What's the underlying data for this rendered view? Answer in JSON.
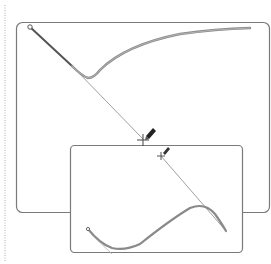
{
  "figure": {
    "colors": {
      "background": "#ffffff",
      "panel_border": "#7a7a7a",
      "curve": "#8a8a8a",
      "curve_dark": "#555555",
      "guide_line": "#a0a0a0",
      "dotted_rule": "#b0b0b0",
      "cursor": "#333333"
    },
    "panels": [
      {
        "name": "panel-1",
        "x": 16,
        "y": 22,
        "width": 254,
        "height": 191,
        "radius": 6,
        "anchor_start": {
          "x": 30,
          "y": 27
        },
        "curve_path": "M 30 27 L 72 66 Q 82 76 88 78 Q 94 78 100 70 Q 125 45 180 34 Q 215 29 250 28",
        "guide_line": {
          "x1": 74,
          "y1": 68,
          "x2": 143,
          "y2": 139
        },
        "crosshair": {
          "x": 143,
          "y": 140
        },
        "pen_cursor": {
          "x": 148,
          "y": 132
        }
      },
      {
        "name": "panel-2",
        "x": 70,
        "y": 145,
        "width": 173,
        "height": 108,
        "radius": 4,
        "anchor_start": {
          "x": 88,
          "y": 229
        },
        "curve_path": "M 88 229 Q 100 244 112 248 Q 125 251 140 244 Q 170 220 190 208 Q 205 202 215 214 Q 222 224 226 231",
        "guide_line": {
          "x1": 161,
          "y1": 156,
          "x2": 226,
          "y2": 231
        },
        "crosshair": {
          "x": 161,
          "y": 156
        },
        "pen_cursor": {
          "x": 165,
          "y": 149
        }
      }
    ],
    "dotted_rule": {
      "x": 5,
      "y1": 5,
      "y2": 262
    }
  }
}
